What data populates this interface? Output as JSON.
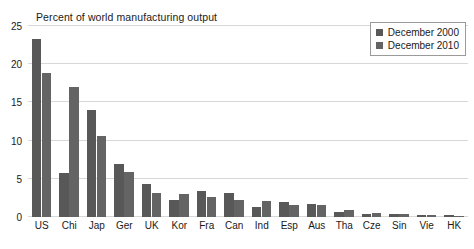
{
  "chart_data": {
    "type": "bar",
    "title": "Percent of world manufacturing output",
    "xlabel": "",
    "ylabel": "",
    "ylim": [
      0,
      25
    ],
    "yticks": [
      0,
      5,
      10,
      15,
      20,
      25
    ],
    "grid": true,
    "legend_position": "top-right",
    "categories": [
      "US",
      "Chi",
      "Jap",
      "Ger",
      "UK",
      "Kor",
      "Fra",
      "Can",
      "Ind",
      "Esp",
      "Aus",
      "Tha",
      "Cze",
      "Sin",
      "Vie",
      "HK"
    ],
    "series": [
      {
        "name": "December 2000",
        "color": "#585858",
        "values": [
          23.3,
          5.8,
          14.0,
          7.0,
          4.3,
          2.2,
          3.4,
          3.2,
          1.3,
          1.9,
          1.7,
          0.7,
          0.4,
          0.4,
          0.2,
          0.2
        ]
      },
      {
        "name": "December 2010",
        "color": "#646464",
        "values": [
          18.9,
          17.0,
          10.6,
          5.9,
          3.1,
          3.0,
          2.6,
          2.2,
          2.1,
          1.6,
          1.6,
          0.9,
          0.5,
          0.4,
          0.3,
          0.1
        ]
      }
    ]
  },
  "legend": {
    "items": [
      {
        "label": "December 2000"
      },
      {
        "label": "December 2010"
      }
    ]
  }
}
